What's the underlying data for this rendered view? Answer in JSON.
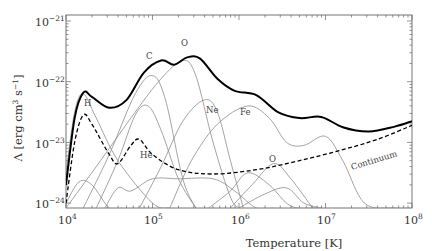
{
  "chart_data": {
    "type": "line",
    "title": "",
    "xlabel": "Temperature [K]",
    "ylabel": "Λ [erg cm^3 s^-1]",
    "xscale": "log",
    "yscale": "log",
    "xlim": [
      10000,
      100000000
    ],
    "ylim": [
      9e-25,
      1.2e-21
    ],
    "x_ticks": [
      "10^4",
      "10^5",
      "10^6",
      "10^7",
      "10^8"
    ],
    "y_ticks": [
      "10^-24",
      "10^-23",
      "10^-22",
      "10^-21"
    ],
    "grid": false,
    "legend": "none (inline curve labels)",
    "series": [
      {
        "name": "Total",
        "style": "thick black solid",
        "points_logT_logL": [
          [
            4.0,
            -23.7
          ],
          [
            4.1,
            -22.6
          ],
          [
            4.2,
            -22.18
          ],
          [
            4.3,
            -22.25
          ],
          [
            4.5,
            -22.43
          ],
          [
            4.7,
            -22.3
          ],
          [
            4.9,
            -21.85
          ],
          [
            5.1,
            -21.65
          ],
          [
            5.25,
            -21.72
          ],
          [
            5.4,
            -21.6
          ],
          [
            5.55,
            -21.62
          ],
          [
            5.75,
            -21.95
          ],
          [
            5.95,
            -22.15
          ],
          [
            6.2,
            -22.22
          ],
          [
            6.45,
            -22.5
          ],
          [
            6.7,
            -22.6
          ],
          [
            6.95,
            -22.58
          ],
          [
            7.2,
            -22.75
          ],
          [
            7.5,
            -22.82
          ],
          [
            7.8,
            -22.74
          ],
          [
            8.0,
            -22.65
          ]
        ]
      },
      {
        "name": "Continuum",
        "style": "black dashed",
        "points_logT_logL": [
          [
            4.0,
            -24.0
          ],
          [
            4.1,
            -23.0
          ],
          [
            4.2,
            -22.55
          ],
          [
            4.3,
            -22.7
          ],
          [
            4.5,
            -23.2
          ],
          [
            4.6,
            -23.35
          ],
          [
            4.75,
            -23.05
          ],
          [
            4.85,
            -22.95
          ],
          [
            5.0,
            -23.2
          ],
          [
            5.3,
            -23.45
          ],
          [
            5.7,
            -23.52
          ],
          [
            6.2,
            -23.45
          ],
          [
            6.7,
            -23.3
          ],
          [
            7.2,
            -23.12
          ],
          [
            7.6,
            -22.95
          ],
          [
            8.0,
            -22.72
          ]
        ]
      },
      {
        "name": "H",
        "label": "H",
        "points_logT_logL": [
          [
            4.0,
            -23.5
          ],
          [
            4.1,
            -22.5
          ],
          [
            4.2,
            -22.2
          ],
          [
            4.35,
            -22.6
          ],
          [
            4.6,
            -23.3
          ],
          [
            5.0,
            -24.0
          ],
          [
            5.2,
            -24.3
          ]
        ]
      },
      {
        "name": "He",
        "label": "He",
        "points_logT_logL": [
          [
            4.35,
            -24.2
          ],
          [
            4.6,
            -23.3
          ],
          [
            4.8,
            -22.55
          ],
          [
            4.95,
            -22.4
          ],
          [
            5.1,
            -22.8
          ],
          [
            5.3,
            -23.6
          ],
          [
            5.5,
            -24.3
          ]
        ]
      },
      {
        "name": "C",
        "label": "C",
        "points_logT_logL": [
          [
            4.2,
            -24.3
          ],
          [
            4.5,
            -23.2
          ],
          [
            4.8,
            -22.2
          ],
          [
            5.0,
            -21.9
          ],
          [
            5.15,
            -22.3
          ],
          [
            5.35,
            -23.6
          ],
          [
            5.5,
            -24.3
          ]
        ]
      },
      {
        "name": "O",
        "label": "O",
        "points_logT_logL": [
          [
            4.0,
            -24.1
          ],
          [
            4.4,
            -23.3
          ],
          [
            4.8,
            -22.5
          ],
          [
            5.1,
            -21.95
          ],
          [
            5.35,
            -21.65
          ],
          [
            5.5,
            -21.9
          ],
          [
            5.7,
            -23.0
          ],
          [
            5.9,
            -23.9
          ],
          [
            6.0,
            -24.3
          ]
        ]
      },
      {
        "name": "Ne",
        "label": "Ne",
        "points_logT_logL": [
          [
            4.85,
            -24.3
          ],
          [
            5.1,
            -23.4
          ],
          [
            5.35,
            -22.65
          ],
          [
            5.6,
            -22.3
          ],
          [
            5.75,
            -22.5
          ],
          [
            5.9,
            -23.3
          ],
          [
            6.05,
            -24.2
          ]
        ]
      },
      {
        "name": "Fe",
        "label": "Fe",
        "points_logT_logL": [
          [
            5.2,
            -24.3
          ],
          [
            5.45,
            -23.3
          ],
          [
            5.75,
            -22.7
          ],
          [
            6.1,
            -22.4
          ],
          [
            6.35,
            -22.6
          ],
          [
            6.55,
            -23.0
          ],
          [
            6.75,
            -23.05
          ],
          [
            7.0,
            -22.9
          ],
          [
            7.2,
            -23.3
          ],
          [
            7.45,
            -24.0
          ],
          [
            7.8,
            -24.1
          ],
          [
            8.0,
            -24.35
          ]
        ]
      },
      {
        "name": "O (second peak)",
        "label": "O",
        "points_logT_logL": [
          [
            5.9,
            -24.3
          ],
          [
            6.15,
            -23.7
          ],
          [
            6.4,
            -23.35
          ],
          [
            6.6,
            -23.6
          ],
          [
            6.85,
            -24.3
          ]
        ]
      },
      {
        "name": "minor-1",
        "style": "thin gray",
        "points_logT_logL": [
          [
            4.0,
            -24.0
          ],
          [
            4.15,
            -23.65
          ],
          [
            4.3,
            -23.7
          ],
          [
            4.5,
            -24.1
          ],
          [
            4.65,
            -24.3
          ]
        ]
      },
      {
        "name": "minor-2",
        "style": "thin gray",
        "points_logT_logL": [
          [
            4.45,
            -24.3
          ],
          [
            4.6,
            -23.75
          ],
          [
            4.75,
            -23.8
          ],
          [
            5.0,
            -23.6
          ],
          [
            5.3,
            -23.6
          ],
          [
            5.7,
            -23.6
          ],
          [
            5.95,
            -23.8
          ],
          [
            6.2,
            -24.1
          ],
          [
            6.4,
            -24.3
          ]
        ]
      },
      {
        "name": "minor-3",
        "style": "thin gray",
        "points_logT_logL": [
          [
            5.65,
            -24.3
          ],
          [
            5.9,
            -23.8
          ],
          [
            6.1,
            -23.5
          ],
          [
            6.35,
            -23.7
          ],
          [
            6.6,
            -24.05
          ],
          [
            6.9,
            -24.3
          ]
        ]
      },
      {
        "name": "minor-4",
        "style": "thin gray",
        "points_logT_logL": [
          [
            6.0,
            -24.2
          ],
          [
            6.3,
            -23.85
          ],
          [
            6.55,
            -23.75
          ],
          [
            6.75,
            -24.0
          ],
          [
            6.95,
            -24.3
          ]
        ]
      }
    ]
  },
  "labels": {
    "x_axis": "Temperature [K]",
    "y_axis": "Λ [erg cm³ s⁻¹]",
    "y_axis_prefix": "Λ [erg cm",
    "y_axis_sup1": "3",
    "y_axis_mid": " s",
    "y_axis_sup2": "−1",
    "y_axis_suffix": "]",
    "continuum": "Continuum",
    "curve_H": "H",
    "curve_He": "He",
    "curve_C": "C",
    "curve_O": "O",
    "curve_Ne": "Ne",
    "curve_Fe": "Fe",
    "curve_O2": "O"
  },
  "ticks": {
    "x": [
      {
        "base": "10",
        "exp": "4"
      },
      {
        "base": "10",
        "exp": "5"
      },
      {
        "base": "10",
        "exp": "6"
      },
      {
        "base": "10",
        "exp": "7"
      },
      {
        "base": "10",
        "exp": "8"
      }
    ],
    "y": [
      {
        "base": "10",
        "exp": "−21"
      },
      {
        "base": "10",
        "exp": "−22"
      },
      {
        "base": "10",
        "exp": "−23"
      },
      {
        "base": "10",
        "exp": "−24"
      }
    ]
  },
  "colors": {
    "total": "#000000",
    "continuum": "#000000",
    "element": "#8c8c8c",
    "axis": "#555555"
  }
}
